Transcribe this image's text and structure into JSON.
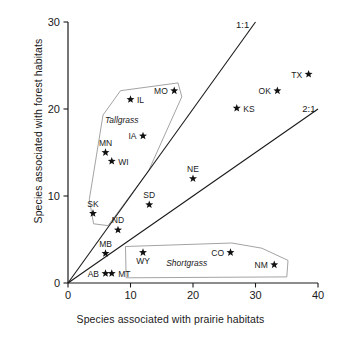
{
  "chart_data": {
    "type": "scatter",
    "title": "",
    "xlabel": "Species associated with prairie habitats",
    "ylabel": "Species associated with forest habitats",
    "xlim": [
      0,
      40
    ],
    "ylim": [
      0,
      30
    ],
    "xticks": [
      "0",
      "10",
      "20",
      "30",
      "40"
    ],
    "yticks": [
      "0",
      "10",
      "20",
      "30"
    ],
    "xtick_values": [
      0,
      10,
      20,
      30,
      40
    ],
    "ytick_values": [
      0,
      10,
      20,
      30
    ],
    "grid": false,
    "legend": "none",
    "marker": "star",
    "points": [
      {
        "label": "IL",
        "x": 10,
        "y": 21.1,
        "label_pos": "right"
      },
      {
        "label": "MO",
        "x": 17,
        "y": 22.1,
        "label_pos": "left"
      },
      {
        "label": "IA",
        "x": 12,
        "y": 16.9,
        "label_pos": "left"
      },
      {
        "label": "MN",
        "x": 6,
        "y": 15.0,
        "label_pos": "above"
      },
      {
        "label": "WI",
        "x": 7,
        "y": 14.0,
        "label_pos": "right"
      },
      {
        "label": "SK",
        "x": 4,
        "y": 8.0,
        "label_pos": "above"
      },
      {
        "label": "ND",
        "x": 8,
        "y": 6.1,
        "label_pos": "above"
      },
      {
        "label": "MB",
        "x": 6,
        "y": 3.4,
        "label_pos": "above"
      },
      {
        "label": "AB",
        "x": 6,
        "y": 1.1,
        "label_pos": "left"
      },
      {
        "label": "MT",
        "x": 7,
        "y": 1.1,
        "label_pos": "right"
      },
      {
        "label": "SD",
        "x": 13,
        "y": 9.0,
        "label_pos": "above"
      },
      {
        "label": "NE",
        "x": 20,
        "y": 12.0,
        "label_pos": "above"
      },
      {
        "label": "WY",
        "x": 12,
        "y": 3.5,
        "label_pos": "below"
      },
      {
        "label": "CO",
        "x": 26,
        "y": 3.5,
        "label_pos": "left"
      },
      {
        "label": "NM",
        "x": 33,
        "y": 2.1,
        "label_pos": "left"
      },
      {
        "label": "KS",
        "x": 27,
        "y": 20.1,
        "label_pos": "right"
      },
      {
        "label": "OK",
        "x": 33.5,
        "y": 22.1,
        "label_pos": "left"
      },
      {
        "label": "TX",
        "x": 38.5,
        "y": 24.0,
        "label_pos": "left"
      }
    ],
    "reference_lines": [
      {
        "label": "1:1",
        "slope": 1.0,
        "from": [
          0,
          0
        ],
        "to": [
          30,
          30
        ]
      },
      {
        "label": "2:1",
        "slope": 0.5,
        "from": [
          0,
          0
        ],
        "to": [
          40,
          20
        ]
      }
    ],
    "annotations": [
      {
        "label": "Tallgrass",
        "style": "italic",
        "x": 8.6,
        "y": 18.4
      },
      {
        "label": "Shortgrass",
        "style": "italic",
        "x": 19.0,
        "y": 2.0
      }
    ],
    "groups": [
      {
        "name": "Tallgrass",
        "polygon": [
          [
            8.4,
            22.1
          ],
          [
            17.6,
            23.0
          ],
          [
            18.2,
            21.4
          ],
          [
            12.9,
            12.9
          ],
          [
            6.4,
            6.6
          ],
          [
            4.1,
            6.8
          ],
          [
            3.4,
            9.6
          ],
          [
            5.6,
            19.3
          ]
        ]
      },
      {
        "name": "Shortgrass",
        "polygon": [
          [
            9.2,
            4.2
          ],
          [
            26.2,
            4.6
          ],
          [
            31.0,
            4.0
          ],
          [
            35.2,
            2.6
          ],
          [
            35.0,
            0.7
          ],
          [
            9.3,
            0.6
          ]
        ]
      }
    ]
  }
}
